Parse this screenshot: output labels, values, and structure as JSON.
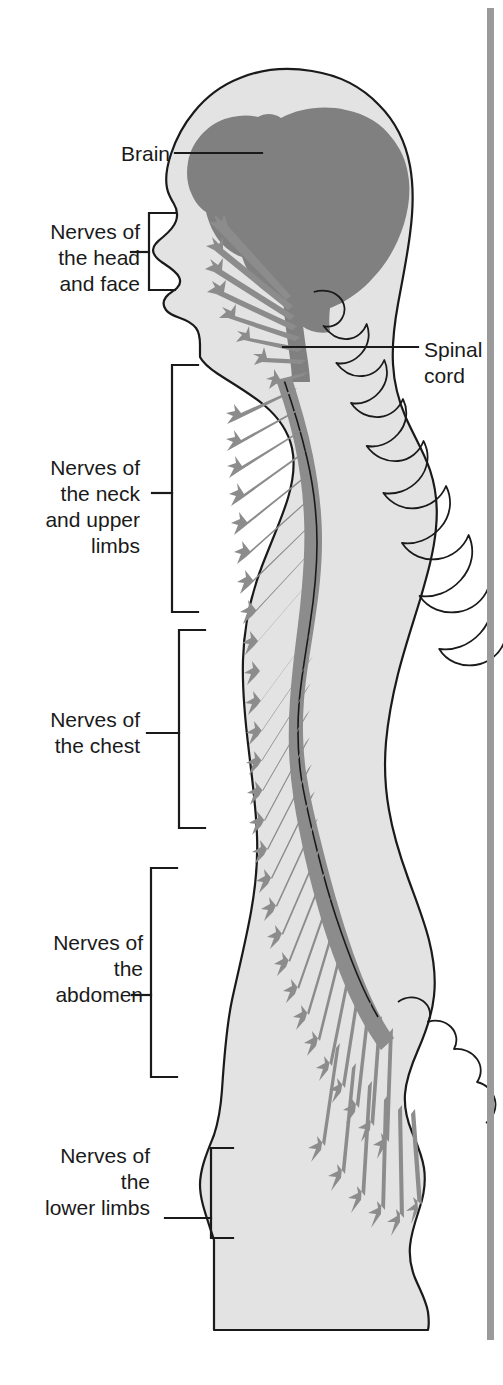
{
  "figure": {
    "background_color": "#ffffff",
    "body_fill": "#e3e3e3",
    "nerve_color": "#8c8c8c",
    "brain_color": "#808080",
    "outline_color": "#1a1a1a",
    "margin_rule_color": "#9a9a9a"
  },
  "labels": {
    "brain": "Brain",
    "nerves_head_face": "Nerves of\nthe head\nand face",
    "nerves_neck_upper_limbs": "Nerves of\nthe neck\nand upper\nlimbs",
    "nerves_chest": "Nerves of\nthe chest",
    "nerves_abdomen": "Nerves of\nthe\nabdomen",
    "nerves_lower_limbs": "Nerves of\nthe\nlower limbs",
    "spinal_cord": "Spinal\ncord"
  },
  "icons": {
    "brain": "brain-icon",
    "spinal_cord": "spinal-cord-icon",
    "vertebral_column": "vertebral-column-icon",
    "nerve_branch": "nerve-branch-icon",
    "body_silhouette": "body-silhouette-icon",
    "bracket": "bracket-icon",
    "leader_line": "leader-line-icon",
    "margin_rule": "margin-rule-icon"
  }
}
